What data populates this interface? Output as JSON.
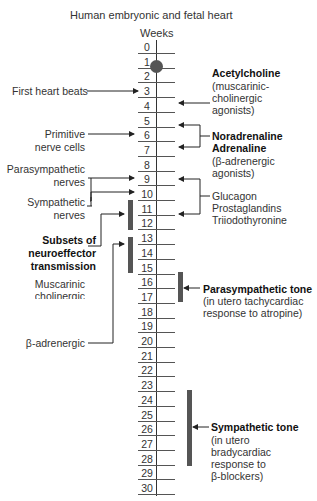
{
  "title": "Human embryonic and fetal heart",
  "axis_label": "Weeks",
  "weeks": [
    "0",
    "1",
    "2",
    "3",
    "4",
    "5",
    "6",
    "7",
    "8",
    "9",
    "10",
    "11",
    "12",
    "13",
    "14",
    "15",
    "16",
    "17",
    "18",
    "19",
    "20",
    "21",
    "22",
    "23",
    "24",
    "25",
    "26",
    "27",
    "28",
    "29",
    "30"
  ],
  "left_labels": {
    "first_heart_beats": "First heart beats",
    "primitive_1": "Primitive",
    "primitive_2": "nerve cells",
    "parasym_1": "Parasympathetic",
    "parasym_2": "nerves",
    "sym_1": "Sympathetic",
    "sym_2": "nerves",
    "subsets_1": "Subsets of",
    "subsets_2": "neuroeffector",
    "subsets_3": "transmission",
    "musc_1": "Muscarinic",
    "musc_2": "cholinergic",
    "beta": "β-adrenergic"
  },
  "right_labels": {
    "ach_1": "Acetylcholine",
    "ach_2": "(muscarinic-",
    "ach_3": "cholinergic",
    "ach_4": "agonists)",
    "nor_1": "Noradrenaline",
    "nor_2": "Adrenaline",
    "nor_3": "(β-adrenergic",
    "nor_4": "agonists)",
    "glu_1": "Glucagon",
    "glu_2": "Prostaglandins",
    "glu_3": "Triiodothyronine",
    "para_1": "Parasympathetic tone",
    "para_2": "(in utero tachycardiac",
    "para_3": "response to atropine)",
    "sym_1": "Sympathetic tone",
    "sym_2": "(in utero",
    "sym_3": "bradycardiac",
    "sym_4": "response to",
    "sym_5": "β-blockers)"
  },
  "colors": {
    "bar": "#555555",
    "line": "#333333",
    "text": "#333333"
  }
}
